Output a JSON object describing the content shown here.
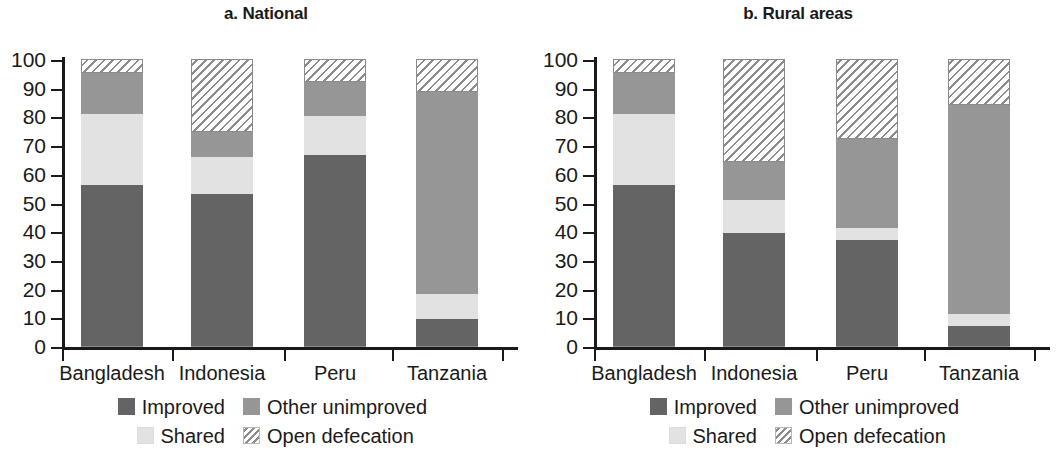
{
  "chart_data": [
    {
      "type": "bar",
      "panel_id": "a",
      "title": "a. National",
      "stacked": true,
      "stack_total": 100,
      "categories": [
        "Bangladesh",
        "Indonesia",
        "Peru",
        "Tanzania"
      ],
      "series": [
        {
          "name": "Improved",
          "values": [
            56,
            53,
            66.5,
            9.5
          ]
        },
        {
          "name": "Shared",
          "values": [
            25,
            13,
            13.5,
            8.5
          ]
        },
        {
          "name": "Other unimproved",
          "values": [
            14,
            8.5,
            12,
            70.5
          ]
        },
        {
          "name": "Open defecation",
          "values": [
            5,
            25.5,
            8,
            11.5
          ]
        }
      ],
      "xlabel": "",
      "ylabel": "",
      "ylim": [
        0,
        100
      ],
      "yticks": [
        0,
        10,
        20,
        30,
        40,
        50,
        60,
        70,
        80,
        90,
        100
      ],
      "grid": false,
      "legend_position": "bottom"
    },
    {
      "type": "bar",
      "panel_id": "b",
      "title": "b. Rural areas",
      "stacked": true,
      "stack_total": 100,
      "categories": [
        "Bangladesh",
        "Indonesia",
        "Peru",
        "Tanzania"
      ],
      "series": [
        {
          "name": "Improved",
          "values": [
            56,
            39.5,
            37,
            7
          ]
        },
        {
          "name": "Shared",
          "values": [
            25,
            11.5,
            4,
            4
          ]
        },
        {
          "name": "Other unimproved",
          "values": [
            14,
            13,
            31,
            73
          ]
        },
        {
          "name": "Open defecation",
          "values": [
            5,
            36,
            28,
            16
          ]
        }
      ],
      "xlabel": "",
      "ylabel": "",
      "ylim": [
        0,
        100
      ],
      "yticks": [
        0,
        10,
        20,
        30,
        40,
        50,
        60,
        70,
        80,
        90,
        100
      ],
      "grid": false,
      "legend_position": "bottom"
    }
  ],
  "panels": [
    {
      "title": "a. National",
      "categories": [
        "Bangladesh",
        "Indonesia",
        "Peru",
        "Tanzania"
      ],
      "yticks": [
        "100",
        "90",
        "80",
        "70",
        "60",
        "50",
        "40",
        "30",
        "20",
        "10",
        "0"
      ],
      "legend": {
        "improved": "Improved",
        "other": "Other unimproved",
        "shared": "Shared",
        "open": "Open defecation"
      }
    },
    {
      "title": "b. Rural areas",
      "categories": [
        "Bangladesh",
        "Indonesia",
        "Peru",
        "Tanzania"
      ],
      "yticks": [
        "100",
        "90",
        "80",
        "70",
        "60",
        "50",
        "40",
        "30",
        "20",
        "10",
        "0"
      ],
      "legend": {
        "improved": "Improved",
        "other": "Other unimproved",
        "shared": "Shared",
        "open": "Open defecation"
      }
    }
  ],
  "colors": {
    "improved": "#646464",
    "shared": "#e2e2e2",
    "other_unimproved": "#969696",
    "open_defecation": "#ffffff",
    "axis": "#1a1a1a",
    "background": "#ffffff"
  }
}
